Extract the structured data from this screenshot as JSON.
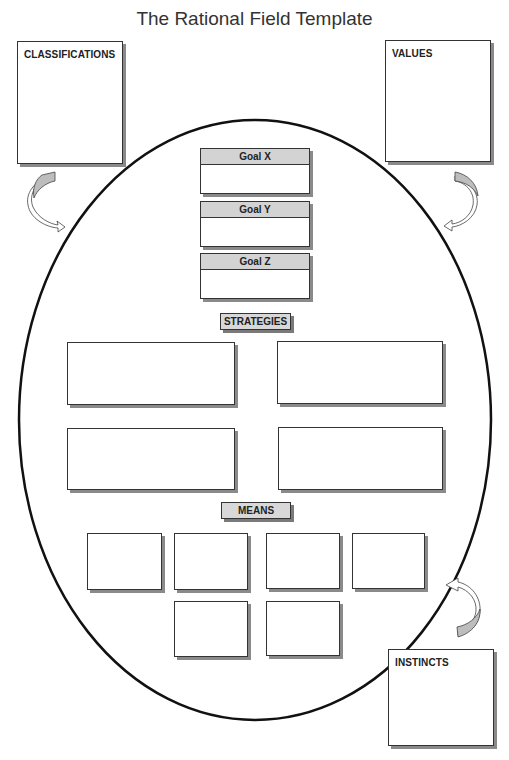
{
  "title": "The Rational Field Template",
  "side_boxes": {
    "classifications": "CLASSIFICATIONS",
    "values": "VALUES",
    "instincts": "INSTINCTS"
  },
  "goals": [
    {
      "label": "Goal X"
    },
    {
      "label": "Goal Y"
    },
    {
      "label": "Goal Z"
    }
  ],
  "sections": {
    "strategies": "STRATEGIES",
    "means": "MEANS"
  },
  "strategy_box_count": 4,
  "means_box_count": 6,
  "arrows": [
    {
      "from": "classifications",
      "to": "field",
      "icon": "curved-arrow-icon"
    },
    {
      "from": "values",
      "to": "field",
      "icon": "curved-arrow-icon"
    },
    {
      "from": "instincts",
      "to": "field",
      "icon": "curved-arrow-icon"
    }
  ]
}
